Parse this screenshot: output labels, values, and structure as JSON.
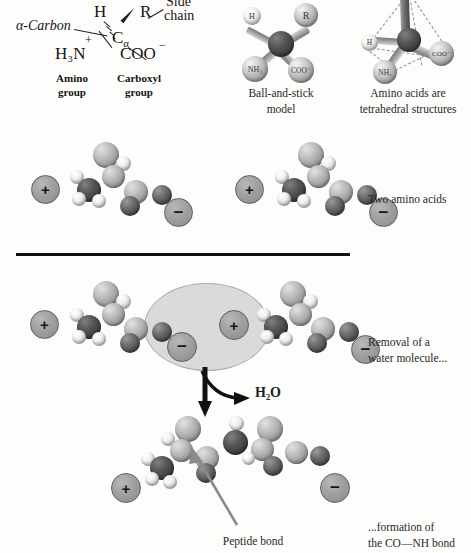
{
  "figure": {
    "panels": {
      "structure": {
        "alpha_carbon_label": "α-Carbon",
        "side_chain_label_line1": "Side",
        "side_chain_label_line2": "chain",
        "atom_h": "H",
        "atom_r": "R",
        "atom_center": "C",
        "atom_center_sub": "α",
        "group_amino_formula": "H₃N",
        "group_amino_charge": "+",
        "group_carboxyl_formula": "COO",
        "group_carboxyl_charge": "−",
        "amino_group_label_line1": "Amino",
        "amino_group_label_line2": "group",
        "carboxyl_group_label_line1": "Carboxyl",
        "carboxyl_group_label_line2": "group"
      },
      "ball_and_stick": {
        "caption_line1": "Ball-and-stick",
        "caption_line2": "model",
        "atom_r": "R",
        "atom_nh3": "NH₃",
        "atom_coo": "COO⁻",
        "atom_h": "H"
      },
      "tetrahedral": {
        "caption_line1": "Amino acids are",
        "caption_line2": "tetrahedral structures",
        "atom_nh3": "NH₃",
        "atom_coo": "COO⁻",
        "atom_h": "H"
      },
      "two_amino_acids": {
        "caption": "Two amino acids",
        "charge_positive": "+",
        "charge_negative": "−"
      },
      "condensation": {
        "caption_line1": "Removal of a",
        "caption_line2": "water molecule...",
        "water_label": "H₂O",
        "water_label_sub": "2",
        "charge_positive": "+",
        "charge_negative": "−"
      },
      "dipeptide": {
        "caption_line1": "...formation of",
        "caption_line2": "the CO—NH bond",
        "peptide_bond_label": "Peptide bond",
        "charge_positive": "+",
        "charge_negative": "−"
      }
    },
    "colors": {
      "background": "#fdfdfc",
      "ink": "#211f1e",
      "divider": "#111111",
      "highlight_fill": "#d9d9d9",
      "charge_fill": "#a0a0a0",
      "pointer_gray": "#8a8a8a"
    }
  }
}
